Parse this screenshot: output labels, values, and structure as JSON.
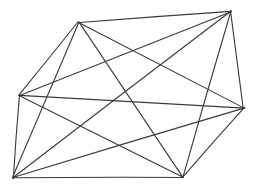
{
  "figure": {
    "kind": "graph-drawing",
    "name": "complete-graph-k6",
    "caption": "",
    "background_color": "#ffffff",
    "width": 257,
    "height": 192
  },
  "chart_data": {
    "type": "scatter",
    "title": "",
    "subtitle": "",
    "xlabel": "",
    "ylabel": "",
    "grid": false,
    "legend": "none",
    "xlim": [
      0,
      257
    ],
    "ylim": [
      0,
      192
    ],
    "graph_type": "complete graph K6",
    "vertex_count": 6,
    "edge_count": 15,
    "vertex_degree": 5,
    "vertex_labels": [
      "A",
      "B",
      "C",
      "D",
      "E",
      "F"
    ],
    "vertices": [
      {
        "id": "A",
        "label": "A",
        "role": "top-left-apex",
        "x": 79,
        "y": 22
      },
      {
        "id": "B",
        "label": "B",
        "role": "top-right-apex",
        "x": 231,
        "y": 11
      },
      {
        "id": "C",
        "label": "C",
        "role": "left-middle",
        "x": 19,
        "y": 95
      },
      {
        "id": "D",
        "label": "D",
        "role": "right-middle",
        "x": 244,
        "y": 108
      },
      {
        "id": "E",
        "label": "E",
        "role": "bottom-left",
        "x": 13,
        "y": 178
      },
      {
        "id": "F",
        "label": "F",
        "role": "bottom-right",
        "x": 183,
        "y": 177
      }
    ],
    "edges": [
      {
        "from": "A",
        "to": "B"
      },
      {
        "from": "A",
        "to": "C"
      },
      {
        "from": "A",
        "to": "D"
      },
      {
        "from": "A",
        "to": "E"
      },
      {
        "from": "A",
        "to": "F"
      },
      {
        "from": "B",
        "to": "C"
      },
      {
        "from": "B",
        "to": "D"
      },
      {
        "from": "B",
        "to": "E"
      },
      {
        "from": "B",
        "to": "F"
      },
      {
        "from": "C",
        "to": "D"
      },
      {
        "from": "C",
        "to": "E"
      },
      {
        "from": "C",
        "to": "F"
      },
      {
        "from": "D",
        "to": "E"
      },
      {
        "from": "D",
        "to": "F"
      },
      {
        "from": "E",
        "to": "F"
      }
    ],
    "style": {
      "stroke_color": "#3a3a3a",
      "stroke_width": 1.1,
      "vertex_marker": "none"
    }
  }
}
